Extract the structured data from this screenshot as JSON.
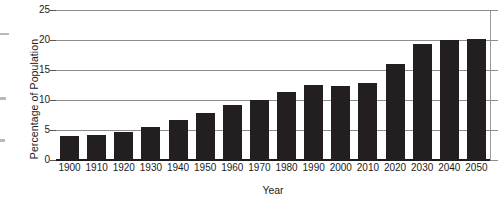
{
  "chart_data": {
    "type": "bar",
    "title": "",
    "xlabel": "Year",
    "ylabel": "Percentage of Population",
    "categories": [
      "1900",
      "1910",
      "1920",
      "1930",
      "1940",
      "1950",
      "1960",
      "1970",
      "1980",
      "1990",
      "2000",
      "2010",
      "2020",
      "2030",
      "2040",
      "2050"
    ],
    "values": [
      4.0,
      4.2,
      4.6,
      5.5,
      6.7,
      7.9,
      9.2,
      10.0,
      11.3,
      12.5,
      12.3,
      12.9,
      16.0,
      19.3,
      20.0,
      20.1
    ],
    "ylim": [
      0,
      25
    ],
    "yticks": [
      0,
      5,
      10,
      15,
      20,
      25
    ],
    "ytick_labels": [
      "0",
      "5",
      "10",
      "15",
      "20",
      "25"
    ],
    "grid": true,
    "legend": null,
    "legend_position": "none",
    "series_color": "#231f20",
    "gridline_color": "#8d8d8d",
    "axis_color": "#1b1b1b"
  }
}
